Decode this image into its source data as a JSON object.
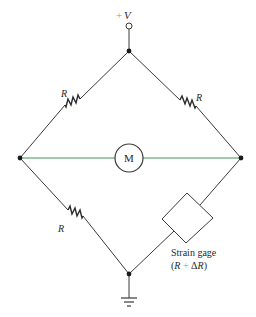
{
  "diagram": {
    "type": "wheatstone-bridge",
    "supply_label": {
      "plus": "+",
      "symbol": "V"
    },
    "resistors": [
      {
        "id": "upper-left",
        "label": "R"
      },
      {
        "id": "upper-right",
        "label": "R"
      },
      {
        "id": "lower-left",
        "label": "R"
      }
    ],
    "meter": {
      "label": "M"
    },
    "strain_gage": {
      "line1": "Strain gage",
      "line2_open": "(",
      "line2_r": "R",
      "line2_plus": "+",
      "line2_delta": "Δ",
      "line2_r2": "R",
      "line2_close": ")"
    },
    "colors": {
      "wire": "#3a3a3a",
      "meter_wire": "#7fb88e",
      "accent_plus": "#6fae7f"
    },
    "nodes": {
      "top": [
        129,
        51
      ],
      "left": [
        20,
        158
      ],
      "right": [
        241,
        158
      ],
      "bottom": [
        129,
        274
      ]
    }
  }
}
